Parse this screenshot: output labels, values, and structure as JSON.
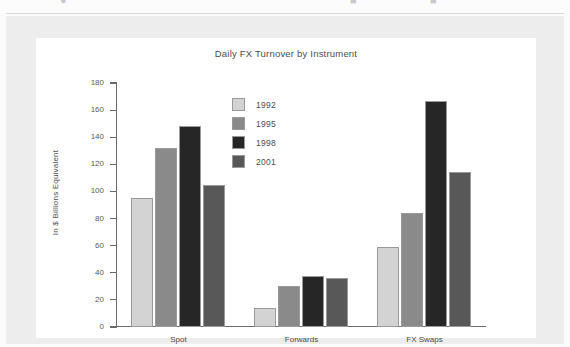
{
  "document": {
    "page_background": "#ededed",
    "figure_background": "#ffffff",
    "top_partial_row": "·",
    "ylabel_text": "In $ Billions Equivalent"
  },
  "chart_data": {
    "type": "bar",
    "title": "Daily FX Turnover by Instrument",
    "xlabel": "",
    "ylabel": "In $ Billions Equivalent",
    "categories": [
      "Spot",
      "Forwards",
      "FX Swaps"
    ],
    "series": [
      {
        "name": "1992",
        "color": "#d3d3d3",
        "values": [
          95,
          14,
          59
        ]
      },
      {
        "name": "1995",
        "color": "#8a8a8a",
        "values": [
          132,
          30,
          84
        ]
      },
      {
        "name": "1998",
        "color": "#262626",
        "values": [
          148,
          38,
          167
        ]
      },
      {
        "name": "2001",
        "color": "#585858",
        "values": [
          105,
          36,
          114
        ]
      }
    ],
    "ylim": [
      0,
      180
    ],
    "yticks": [
      0,
      20,
      40,
      60,
      80,
      100,
      120,
      140,
      160,
      180
    ],
    "ytick_labels": [
      "0",
      "20",
      "40",
      "60",
      "80",
      "100",
      "120",
      "140",
      "160",
      "180"
    ],
    "grid": false,
    "legend_position": "inside-upper-center",
    "legend_entries": [
      "1992",
      "1995",
      "1998",
      "2001"
    ],
    "axis_color": "#6b6b6b",
    "bar_edge_color": "#9a9a9a"
  }
}
